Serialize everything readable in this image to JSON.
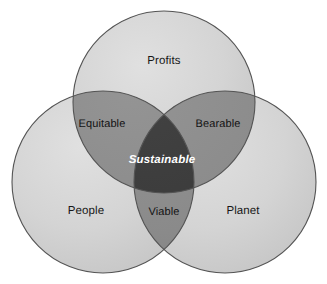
{
  "diagram": {
    "type": "venn-3-circle",
    "background_color": "#ffffff",
    "canvas": {
      "width": 327,
      "height": 284
    },
    "colors": {
      "circle_fill": "#d2d2d2",
      "pair_overlap_fill": "#8a8a8a",
      "center_overlap_fill": "#3a3a3a",
      "stroke": "#545454",
      "label_text": "#171717",
      "center_label_text": "#ffffff"
    },
    "circles": [
      {
        "id": "profits",
        "label": "Profits",
        "cx": 164,
        "cy": 102,
        "r": 91,
        "label_x": 164,
        "label_y": 62
      },
      {
        "id": "people",
        "label": "People",
        "cx": 103,
        "cy": 182,
        "r": 91,
        "label_x": 86,
        "label_y": 212
      },
      {
        "id": "planet",
        "label": "Planet",
        "cx": 225,
        "cy": 182,
        "r": 91,
        "label_x": 243,
        "label_y": 212
      }
    ],
    "intersections": [
      {
        "id": "equitable",
        "label": "Equitable",
        "between": "Profits + People",
        "label_x": 102,
        "label_y": 124
      },
      {
        "id": "bearable",
        "label": "Bearable",
        "between": "Profits + Planet",
        "label_x": 218,
        "label_y": 124
      },
      {
        "id": "viable",
        "label": "Viable",
        "between": "People + Planet",
        "label_x": 164,
        "label_y": 212
      },
      {
        "id": "sustainable",
        "label": "Sustainable",
        "between": "Profits + People + Planet",
        "label_x": 162,
        "label_y": 161
      }
    ]
  }
}
